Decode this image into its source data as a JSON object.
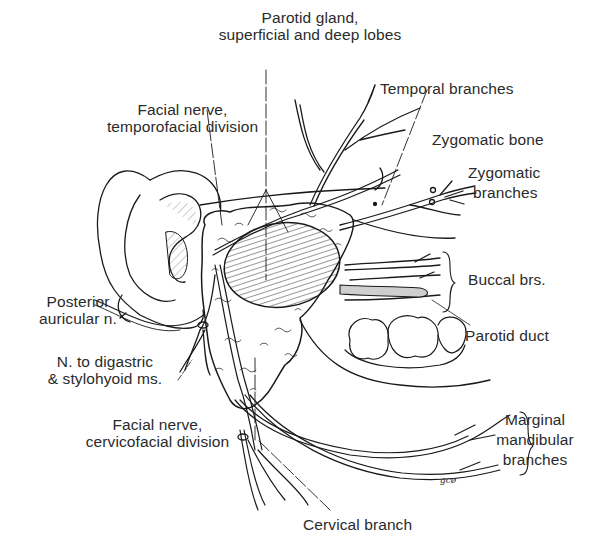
{
  "figure": {
    "style": "black-and-white line illustration",
    "artist_initials": "gcø"
  },
  "labels": {
    "parotid_gland": [
      "Parotid gland,",
      "superficial and deep lobes"
    ],
    "temporal_branches": "Temporal branches",
    "facial_nerve_temporofacial": [
      "Facial nerve,",
      "temporofacial division"
    ],
    "zygomatic_bone": "Zygomatic bone",
    "zygomatic_branches": [
      "Zygomatic",
      "branches"
    ],
    "buccal_branches": "Buccal brs.",
    "posterior_auricular": [
      "Posterior",
      "auricular n."
    ],
    "parotid_duct": "Parotid duct",
    "nerve_to_digastric": [
      "N. to digastric",
      "& stylohyoid ms."
    ],
    "facial_nerve_cervicofacial": [
      "Facial nerve,",
      "cervicofacial division"
    ],
    "marginal_mandibular": [
      "Marginal",
      "mandibular",
      "branches"
    ],
    "cervical_branch": "Cervical branch"
  },
  "colors": {
    "ink": "#1a1a1a",
    "text": "#2b2b2b",
    "background": "#ffffff"
  }
}
